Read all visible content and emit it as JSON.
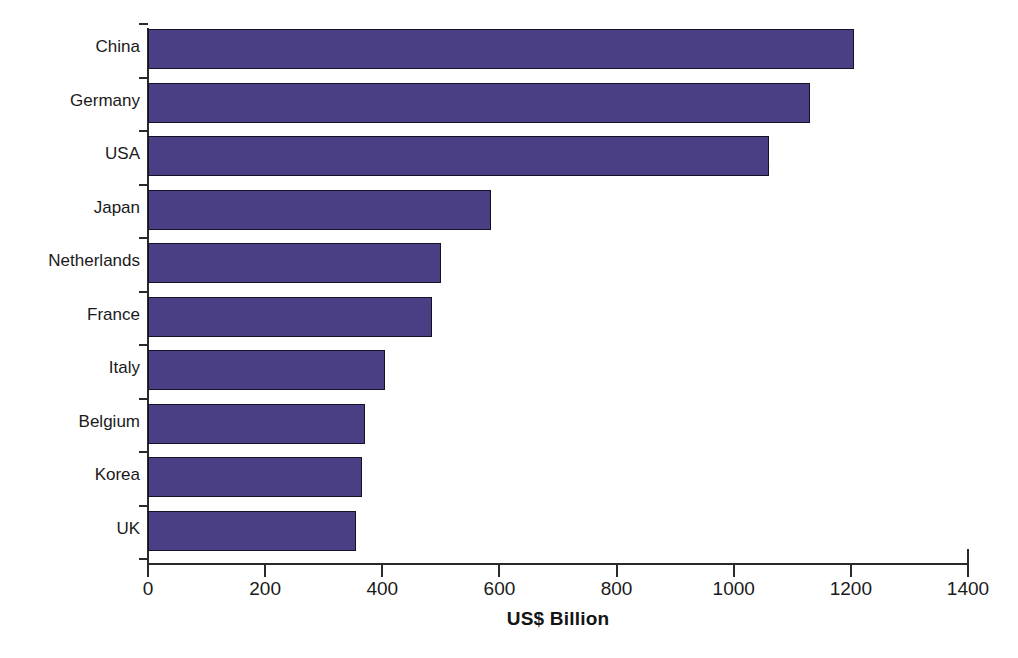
{
  "caption": {
    "clipped_top_line": "top caption line cropped out of frame"
  },
  "chart_data": {
    "type": "bar",
    "orientation": "horizontal",
    "title": "",
    "xlabel": "US$ Billion",
    "ylabel": "",
    "xlim": [
      0,
      1400
    ],
    "xticks": [
      0,
      200,
      400,
      600,
      800,
      1000,
      1200,
      1400
    ],
    "xtick_labels": [
      "0",
      "200",
      "400",
      "600",
      "800",
      "1000",
      "1200",
      "1400"
    ],
    "grid": false,
    "legend": null,
    "bar_color": "#4a3f85",
    "bar_edge_color": "#151225",
    "categories": [
      "China",
      "Germany",
      "USA",
      "Japan",
      "Netherlands",
      "France",
      "Italy",
      "Belgium",
      "Korea",
      "UK"
    ],
    "values": [
      1205,
      1130,
      1060,
      585,
      500,
      485,
      405,
      370,
      365,
      355
    ],
    "units": "US$ Billion"
  },
  "axis": {
    "x_title": "US$ Billion"
  }
}
